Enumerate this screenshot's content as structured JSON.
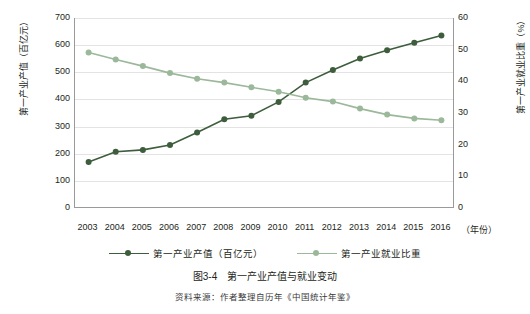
{
  "chart_data": {
    "type": "line",
    "title": "图3-4　第一产业产值与就业变动",
    "source": "资料来源：作者整理自历年《中国统计年鉴》",
    "xlabel": "（年份）",
    "ylabel_left": "第一产业产值（百亿元）",
    "ylabel_right": "第一产业就业比重（%）",
    "categories": [
      "2003",
      "2004",
      "2005",
      "2006",
      "2007",
      "2008",
      "2009",
      "2010",
      "2011",
      "2012",
      "2013",
      "2014",
      "2015",
      "2016"
    ],
    "ylim_left": [
      0,
      700
    ],
    "yticks_left": [
      "0",
      "100",
      "200",
      "300",
      "400",
      "500",
      "600",
      "700"
    ],
    "ylim_right": [
      0,
      60
    ],
    "yticks_right": [
      "0",
      "10",
      "20",
      "30",
      "40",
      "50",
      "60"
    ],
    "grid": true,
    "legend_position": "bottom",
    "series": [
      {
        "name": "第一产业产值（百亿元）",
        "axis": "left",
        "color": "#3d5d3c",
        "values": [
          170,
          207,
          214,
          232,
          278,
          327,
          340,
          391,
          462,
          508,
          551,
          581,
          609,
          636
        ]
      },
      {
        "name": "第一产业就业比重",
        "axis": "right",
        "color": "#9bb89a",
        "values": [
          49.1,
          46.9,
          44.8,
          42.6,
          40.8,
          39.6,
          38.1,
          36.7,
          34.8,
          33.6,
          31.4,
          29.5,
          28.3,
          27.7
        ]
      }
    ]
  },
  "legend": {
    "items": [
      {
        "label": "第一产业产值（百亿元）",
        "color": "#3d5d3c"
      },
      {
        "label": "第一产业就业比重",
        "color": "#9bb89a"
      }
    ]
  }
}
